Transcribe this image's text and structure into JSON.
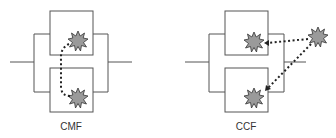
{
  "diagrams": [
    {
      "id": "cmf",
      "label": "CMF"
    },
    {
      "id": "ccf",
      "label": "CCF"
    }
  ],
  "colors": {
    "line": "#555555",
    "star_fill": "#9a9a9a",
    "star_stroke": "#333333",
    "dots": "#222222"
  }
}
